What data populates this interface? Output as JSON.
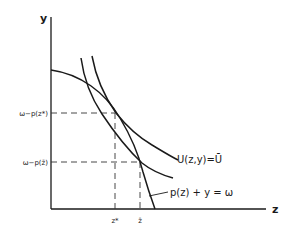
{
  "diagram": {
    "axes": {
      "x_label": "z",
      "y_label": "y"
    },
    "y_ticks": [
      {
        "id": "y_star",
        "label": "ω−p(z*)"
      },
      {
        "id": "y_bar",
        "label": "ω−p(z̄)"
      }
    ],
    "x_ticks": [
      {
        "id": "z_star",
        "label": "z*"
      },
      {
        "id": "z_bar",
        "label": "z̄"
      }
    ],
    "curves": [
      {
        "id": "budget",
        "label": "p(z) + y = ω",
        "shape": "concave, decreasing"
      },
      {
        "id": "indiff_low",
        "label": "",
        "shape": "convex, decreasing"
      },
      {
        "id": "indiff_high",
        "label": "U(z,y) = Ū",
        "shape": "convex, decreasing"
      }
    ],
    "labels": {
      "utility": "U(z,y)=Ū",
      "budget": "p(z) + y = ω"
    }
  }
}
